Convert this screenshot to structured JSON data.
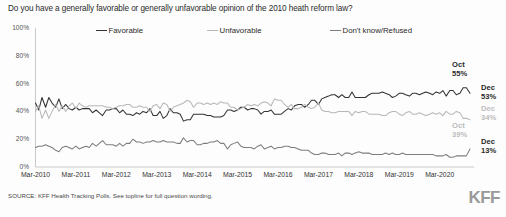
{
  "chart_data": {
    "type": "line",
    "title": "Do you have a generally favorable or generally unfavorable opinion of the 2010 heath reform law?",
    "xlabel": "",
    "ylabel": "",
    "ylim": [
      0,
      100
    ],
    "xlim": [
      "Mar-2010",
      "Dec-2020"
    ],
    "grid": false,
    "legend_position": "top",
    "ytick_labels": [
      "100%",
      "80%",
      "60%",
      "40%",
      "20%",
      "0%"
    ],
    "ytick_values": [
      100,
      80,
      60,
      40,
      20,
      0
    ],
    "xtick_labels": [
      "Mar-2010",
      "Mar-2011",
      "Mar-2012",
      "Mar-2013",
      "Mar-2014",
      "Mar-2015",
      "Mar-2016",
      "Mar-2017",
      "Mar-2018",
      "Mar-2019",
      "Mar-2020"
    ],
    "xtick_values": [
      2010.17,
      2011.17,
      2012.17,
      2013.17,
      2014.17,
      2015.17,
      2016.17,
      2017.17,
      2018.17,
      2019.17,
      2020.17
    ],
    "series": [
      {
        "name": "Favorable",
        "color": "#333333",
        "x": [
          2010.17,
          2010.25,
          2010.33,
          2010.42,
          2010.5,
          2010.58,
          2010.67,
          2010.75,
          2010.83,
          2010.92,
          2011.0,
          2011.08,
          2011.17,
          2011.25,
          2011.33,
          2011.42,
          2011.5,
          2011.58,
          2011.67,
          2011.75,
          2011.83,
          2011.92,
          2012.0,
          2012.08,
          2012.17,
          2012.25,
          2012.33,
          2012.42,
          2012.5,
          2012.58,
          2012.67,
          2012.75,
          2012.83,
          2012.92,
          2013.0,
          2013.08,
          2013.17,
          2013.25,
          2013.33,
          2013.42,
          2013.5,
          2013.58,
          2013.67,
          2013.75,
          2013.83,
          2013.92,
          2014.0,
          2014.08,
          2014.17,
          2014.25,
          2014.33,
          2014.42,
          2014.5,
          2014.58,
          2014.67,
          2014.75,
          2014.83,
          2014.92,
          2015.0,
          2015.08,
          2015.17,
          2015.25,
          2015.33,
          2015.42,
          2015.5,
          2015.58,
          2015.67,
          2015.75,
          2015.83,
          2015.92,
          2016.0,
          2016.08,
          2016.17,
          2016.25,
          2016.33,
          2016.42,
          2016.5,
          2016.58,
          2016.67,
          2016.75,
          2016.83,
          2016.92,
          2017.0,
          2017.08,
          2017.17,
          2017.25,
          2017.33,
          2017.42,
          2017.5,
          2017.58,
          2017.67,
          2017.75,
          2017.83,
          2017.92,
          2018.0,
          2018.08,
          2018.17,
          2018.25,
          2018.33,
          2018.42,
          2018.5,
          2018.58,
          2018.67,
          2018.75,
          2018.83,
          2018.92,
          2019.0,
          2019.08,
          2019.17,
          2019.25,
          2019.33,
          2019.42,
          2019.5,
          2019.58,
          2019.67,
          2019.75,
          2019.83,
          2019.92,
          2020.0,
          2020.08,
          2020.17,
          2020.25,
          2020.33,
          2020.42,
          2020.5,
          2020.58,
          2020.67,
          2020.75,
          2020.83,
          2020.92
        ],
        "values": [
          46,
          41,
          50,
          43,
          50,
          46,
          43,
          49,
          42,
          45,
          42,
          41,
          43,
          41,
          42,
          42,
          42,
          39,
          41,
          39,
          37,
          41,
          41,
          42,
          42,
          39,
          41,
          38,
          38,
          37,
          39,
          38,
          40,
          39,
          42,
          37,
          37,
          40,
          35,
          37,
          42,
          39,
          39,
          38,
          33,
          34,
          34,
          38,
          38,
          38,
          38,
          37,
          37,
          36,
          36,
          36,
          37,
          41,
          41,
          40,
          41,
          43,
          43,
          41,
          42,
          42,
          41,
          38,
          40,
          40,
          41,
          38,
          38,
          38,
          40,
          42,
          41,
          44,
          45,
          45,
          43,
          45,
          48,
          48,
          45,
          49,
          50,
          51,
          52,
          52,
          50,
          52,
          50,
          50,
          54,
          50,
          50,
          50,
          50,
          52,
          53,
          53,
          53,
          54,
          53,
          52,
          50,
          51,
          53,
          53,
          52,
          51,
          53,
          53,
          52,
          53,
          54,
          53,
          52,
          54,
          53,
          55,
          51,
          55,
          55,
          52,
          53,
          57,
          57,
          53
        ]
      },
      {
        "name": "Unfavorable",
        "color": "#b8b8b8",
        "x": [
          2010.17,
          2010.25,
          2010.33,
          2010.42,
          2010.5,
          2010.58,
          2010.67,
          2010.75,
          2010.83,
          2010.92,
          2011.0,
          2011.08,
          2011.17,
          2011.25,
          2011.33,
          2011.42,
          2011.5,
          2011.58,
          2011.67,
          2011.75,
          2011.83,
          2011.92,
          2012.0,
          2012.08,
          2012.17,
          2012.25,
          2012.33,
          2012.42,
          2012.5,
          2012.58,
          2012.67,
          2012.75,
          2012.83,
          2012.92,
          2013.0,
          2013.08,
          2013.17,
          2013.25,
          2013.33,
          2013.42,
          2013.5,
          2013.58,
          2013.67,
          2013.75,
          2013.83,
          2013.92,
          2014.0,
          2014.08,
          2014.17,
          2014.25,
          2014.33,
          2014.42,
          2014.5,
          2014.58,
          2014.67,
          2014.75,
          2014.83,
          2014.92,
          2015.0,
          2015.08,
          2015.17,
          2015.25,
          2015.33,
          2015.42,
          2015.5,
          2015.58,
          2015.67,
          2015.75,
          2015.83,
          2015.92,
          2016.0,
          2016.08,
          2016.17,
          2016.25,
          2016.33,
          2016.42,
          2016.5,
          2016.58,
          2016.67,
          2016.75,
          2016.83,
          2016.92,
          2017.0,
          2017.08,
          2017.17,
          2017.25,
          2017.33,
          2017.42,
          2017.5,
          2017.58,
          2017.67,
          2017.75,
          2017.83,
          2017.92,
          2018.0,
          2018.08,
          2018.17,
          2018.25,
          2018.33,
          2018.42,
          2018.5,
          2018.58,
          2018.67,
          2018.75,
          2018.83,
          2018.92,
          2019.0,
          2019.08,
          2019.17,
          2019.25,
          2019.33,
          2019.42,
          2019.5,
          2019.58,
          2019.67,
          2019.75,
          2019.83,
          2019.92,
          2020.0,
          2020.08,
          2020.17,
          2020.25,
          2020.33,
          2020.42,
          2020.5,
          2020.58,
          2020.67,
          2020.75,
          2020.83,
          2020.92
        ],
        "values": [
          40,
          44,
          35,
          41,
          35,
          40,
          45,
          40,
          44,
          40,
          44,
          46,
          42,
          46,
          44,
          43,
          44,
          44,
          44,
          44,
          44,
          43,
          43,
          42,
          43,
          44,
          44,
          45,
          45,
          43,
          43,
          44,
          43,
          43,
          40,
          44,
          45,
          42,
          46,
          45,
          40,
          43,
          44,
          45,
          46,
          48,
          47,
          43,
          46,
          46,
          45,
          46,
          45,
          46,
          45,
          47,
          46,
          46,
          43,
          43,
          41,
          42,
          43,
          45,
          44,
          45,
          44,
          46,
          47,
          46,
          44,
          49,
          48,
          48,
          45,
          43,
          45,
          42,
          42,
          43,
          45,
          43,
          42,
          43,
          46,
          41,
          40,
          40,
          39,
          39,
          40,
          40,
          40,
          40,
          37,
          40,
          39,
          40,
          40,
          38,
          38,
          38,
          38,
          37,
          37,
          39,
          40,
          40,
          38,
          37,
          39,
          40,
          38,
          38,
          39,
          38,
          37,
          38,
          39,
          38,
          39,
          37,
          40,
          38,
          38,
          40,
          39,
          35,
          35,
          34
        ]
      },
      {
        "name": "Don't know/Refused",
        "color": "#7d7d7d",
        "x": [
          2010.17,
          2010.25,
          2010.33,
          2010.42,
          2010.5,
          2010.58,
          2010.67,
          2010.75,
          2010.83,
          2010.92,
          2011.0,
          2011.08,
          2011.17,
          2011.25,
          2011.33,
          2011.42,
          2011.5,
          2011.58,
          2011.67,
          2011.75,
          2011.83,
          2011.92,
          2012.0,
          2012.08,
          2012.17,
          2012.25,
          2012.33,
          2012.42,
          2012.5,
          2012.58,
          2012.67,
          2012.75,
          2012.83,
          2012.92,
          2013.0,
          2013.08,
          2013.17,
          2013.25,
          2013.33,
          2013.42,
          2013.5,
          2013.58,
          2013.67,
          2013.75,
          2013.83,
          2013.92,
          2014.0,
          2014.08,
          2014.17,
          2014.25,
          2014.33,
          2014.42,
          2014.5,
          2014.58,
          2014.67,
          2014.75,
          2014.83,
          2014.92,
          2015.0,
          2015.08,
          2015.17,
          2015.25,
          2015.33,
          2015.42,
          2015.5,
          2015.58,
          2015.67,
          2015.75,
          2015.83,
          2015.92,
          2016.0,
          2016.08,
          2016.17,
          2016.25,
          2016.33,
          2016.42,
          2016.5,
          2016.58,
          2016.67,
          2016.75,
          2016.83,
          2016.92,
          2017.0,
          2017.08,
          2017.17,
          2017.25,
          2017.33,
          2017.42,
          2017.5,
          2017.58,
          2017.67,
          2017.75,
          2017.83,
          2017.92,
          2018.0,
          2018.08,
          2018.17,
          2018.25,
          2018.33,
          2018.42,
          2018.5,
          2018.58,
          2018.67,
          2018.75,
          2018.83,
          2018.92,
          2019.0,
          2019.08,
          2019.17,
          2019.25,
          2019.33,
          2019.42,
          2019.5,
          2019.58,
          2019.67,
          2019.75,
          2019.83,
          2019.92,
          2020.0,
          2020.08,
          2020.17,
          2020.25,
          2020.33,
          2020.42,
          2020.5,
          2020.58,
          2020.67,
          2020.75,
          2020.83,
          2020.92
        ],
        "values": [
          14,
          15,
          15,
          16,
          15,
          14,
          12,
          11,
          14,
          15,
          14,
          13,
          15,
          13,
          14,
          15,
          14,
          17,
          15,
          17,
          19,
          16,
          16,
          16,
          15,
          17,
          15,
          17,
          17,
          20,
          18,
          18,
          17,
          18,
          18,
          19,
          18,
          18,
          19,
          18,
          18,
          18,
          17,
          17,
          21,
          18,
          19,
          19,
          16,
          16,
          17,
          17,
          18,
          18,
          19,
          17,
          17,
          13,
          16,
          17,
          18,
          15,
          14,
          14,
          14,
          13,
          15,
          16,
          13,
          14,
          15,
          13,
          14,
          14,
          15,
          15,
          14,
          14,
          13,
          12,
          12,
          12,
          10,
          9,
          9,
          10,
          10,
          9,
          9,
          9,
          10,
          8,
          10,
          10,
          9,
          10,
          11,
          10,
          10,
          10,
          9,
          9,
          9,
          9,
          10,
          9,
          10,
          9,
          9,
          10,
          9,
          9,
          9,
          9,
          9,
          9,
          9,
          9,
          9,
          8,
          8,
          8,
          9,
          7,
          7,
          8,
          8,
          8,
          8,
          13
        ]
      }
    ],
    "annotations": [
      {
        "id": "oct55",
        "label_line1": "Oct",
        "label_line2": "55%",
        "series": "Favorable",
        "color": "#2b2b2b"
      },
      {
        "id": "dec53",
        "label_line1": "Dec",
        "label_line2": "53%",
        "series": "Favorable",
        "color": "#2b2b2b"
      },
      {
        "id": "dec34",
        "label_line1": "Dec",
        "label_line2": "34%",
        "series": "Unfavorable",
        "color": "#bcbcbc"
      },
      {
        "id": "oct39",
        "label_line1": "Oct",
        "label_line2": "39%",
        "series": "Unfavorable",
        "color": "#bcbcbc"
      },
      {
        "id": "dec13",
        "label_line1": "Dec",
        "label_line2": "13%",
        "series": "Don't know/Refused",
        "color": "#2b2b2b"
      }
    ]
  },
  "legend": {
    "favorable": "Favorable",
    "unfavorable": "Unfavorable",
    "dontknow": "Don't know/Refused"
  },
  "annotations_text": {
    "oct55_line1": "Oct",
    "oct55_line2": "55%",
    "dec53_line1": "Dec",
    "dec53_line2": "53%",
    "dec34_line1": "Dec",
    "dec34_line2": "34%",
    "oct39_line1": "Oct",
    "oct39_line2": "39%",
    "dec13_line1": "Dec",
    "dec13_line2": "13%"
  },
  "footer": {
    "source": "SOURCE: KFF Health Tracking Polls. See topline for full question wording.",
    "logo": "KFF"
  }
}
